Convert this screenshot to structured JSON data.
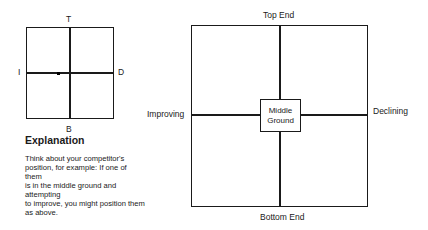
{
  "small_grid": {
    "top_label": "T",
    "bottom_label": "B",
    "left_label": "I",
    "right_label": "D",
    "marker": "competitor-position-dot"
  },
  "explanation": {
    "heading": "Explanation",
    "lines": [
      "Think about your competitor's",
      "position, for example: If one of them",
      "is in the middle ground and attempting",
      "to improve, you might position them",
      "as above."
    ]
  },
  "large_grid": {
    "top_label": "Top End",
    "bottom_label": "Bottom End",
    "left_label": "Improving",
    "right_label": "Declining",
    "center_box": {
      "line1": "Middle",
      "line2": "Ground"
    }
  }
}
